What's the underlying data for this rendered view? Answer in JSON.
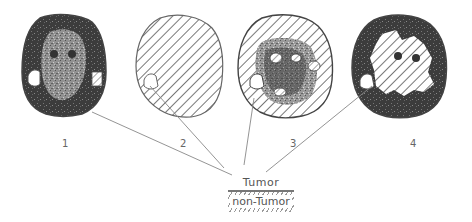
{
  "figure": {
    "panels": [
      {
        "id": "1",
        "label": "1",
        "style": "dark-gray texture, small hatched region on right"
      },
      {
        "id": "2",
        "label": "2",
        "style": "fully hatched, small white region lower left"
      },
      {
        "id": "3",
        "label": "3",
        "style": "mixed gray texture with multiple hatched regions"
      },
      {
        "id": "4",
        "label": "4",
        "style": "large central hatched region with dark rim"
      }
    ],
    "legend": {
      "tumor_label": "Tumor",
      "non_tumor_label": "non-Tumor"
    },
    "colors": {
      "background": "#ffffff",
      "dark_tissue": "#3a3a3a",
      "mid_tissue": "#8a8a8a",
      "hatch": "#555555",
      "line": "#888888"
    }
  }
}
